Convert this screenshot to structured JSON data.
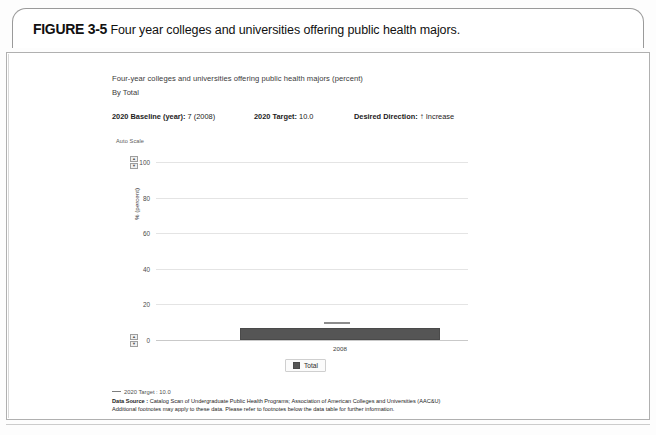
{
  "figure": {
    "number": "FIGURE 3-5",
    "title": "Four year colleges and universities offering public health majors."
  },
  "chart_header": {
    "title": "Four-year colleges and universities offering public health majors (percent)",
    "subtitle": "By Total",
    "baseline_label": "2020 Baseline (year):",
    "baseline_value": "7 (2008)",
    "target_label": "2020 Target:",
    "target_value": "10.0",
    "direction_label": "Desired Direction:",
    "direction_value": "Increase",
    "direction_icon": "arrow-up-icon",
    "auto_scale_label": "Auto Scale"
  },
  "legend": {
    "items": [
      {
        "label": "Total",
        "color": "#555555"
      }
    ]
  },
  "footer": {
    "target_legend": "2020 Target : 10.0",
    "source_label": "Data Source :",
    "source_value": "Catalog Scan of Undergraduate Public Health Programs; Association of American Colleges and Universities (AAC&U)",
    "note": "Additional footnotes may apply to these data. Please refer to footnotes below the data table for further information."
  },
  "spinners": {
    "up_glyph": "▲",
    "down_glyph": "▼"
  },
  "chart_data": {
    "type": "bar",
    "title": "Four-year colleges and universities offering public health majors (percent)",
    "subtitle": "By Total",
    "xlabel": "",
    "ylabel": "% (percent)",
    "categories": [
      "2008"
    ],
    "series": [
      {
        "name": "Total",
        "values": [
          7
        ],
        "color": "#555555"
      }
    ],
    "ylim": [
      0,
      100
    ],
    "yticks": [
      0,
      20,
      40,
      60,
      80,
      100
    ],
    "ytick_labels": [
      "0",
      "20",
      "40",
      "60",
      "80",
      "100"
    ],
    "grid": true,
    "legend_position": "bottom",
    "annotations": [
      {
        "type": "target-line",
        "label": "2020 Target",
        "value": 10.0,
        "color": "#8d8d8d"
      }
    ]
  }
}
